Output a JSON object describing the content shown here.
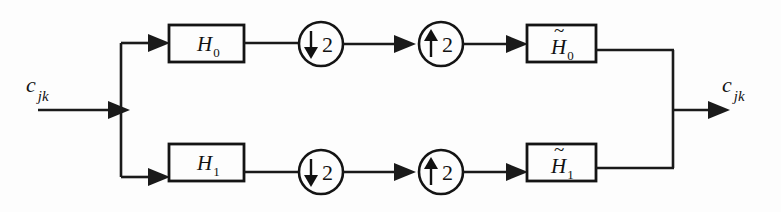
{
  "diagram": {
    "input_signal": {
      "base": "c",
      "subscript": "jk"
    },
    "output_signal": {
      "base": "c",
      "subscript": "jk"
    },
    "colors": {
      "line": "#1a1a1a",
      "box_stroke": "#141414",
      "background": "#fdfdfd",
      "text": "#121212"
    },
    "branches": [
      {
        "id": "upper",
        "analysis_filter": {
          "base": "H",
          "subscript": "0",
          "tilde": false
        },
        "downsampler": {
          "glyph": "↓",
          "factor": "2"
        },
        "upsampler": {
          "glyph": "↑",
          "factor": "2"
        },
        "synthesis_filter": {
          "base": "H",
          "subscript": "0",
          "tilde": true
        }
      },
      {
        "id": "lower",
        "analysis_filter": {
          "base": "H",
          "subscript": "1",
          "tilde": false
        },
        "downsampler": {
          "glyph": "↓",
          "factor": "2"
        },
        "upsampler": {
          "glyph": "↑",
          "factor": "2"
        },
        "synthesis_filter": {
          "base": "H",
          "subscript": "1",
          "tilde": true
        }
      }
    ]
  }
}
